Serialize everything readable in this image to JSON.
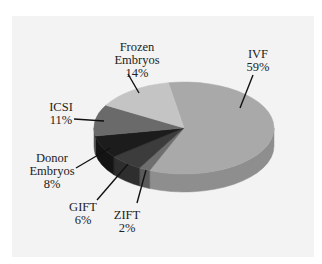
{
  "chart_data": {
    "type": "pie",
    "style": "3d",
    "title": "",
    "slices": [
      {
        "label": "IVF",
        "value": 59,
        "display": "59%",
        "color": "#a9a9a9",
        "side_color": "#8e8e8e"
      },
      {
        "label": "ZIFT",
        "value": 2,
        "display": "2%",
        "color": "#6e6e6e",
        "side_color": "#5a5a5a"
      },
      {
        "label": "GIFT",
        "value": 6,
        "display": "6%",
        "color": "#3c3c3c",
        "side_color": "#2e2e2e"
      },
      {
        "label": "Donor Embryos",
        "value": 8,
        "display": "8%",
        "color": "#1c1c1c",
        "side_color": "#141414"
      },
      {
        "label": "ICSI",
        "value": 11,
        "display": "11%",
        "color": "#6a6a6a",
        "side_color": "#555555"
      },
      {
        "label": "Frozen Embryos",
        "value": 14,
        "display": "14%",
        "color": "#c4c4c4",
        "side_color": "#aaaaaa"
      }
    ],
    "legend": "none (leader-line labels)",
    "start_angle_deg": -100
  },
  "labels": {
    "ivf": {
      "line1": "IVF",
      "line2": "59%"
    },
    "frozen": {
      "line1": "Frozen",
      "line2": "Embryos",
      "line3": "14%"
    },
    "icsi": {
      "line1": "ICSI",
      "line2": "11%"
    },
    "donor": {
      "line1": "Donor",
      "line2": "Embryos",
      "line3": "8%"
    },
    "gift": {
      "line1": "GIFT",
      "line2": "6%"
    },
    "zift": {
      "line1": "ZIFT",
      "line2": "2%"
    }
  }
}
